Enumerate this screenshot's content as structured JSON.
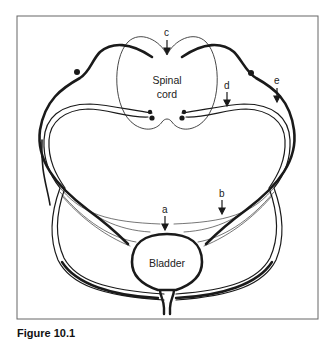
{
  "figure": {
    "caption": "Figure 10.1",
    "colors": {
      "stroke": "#1a1a1a",
      "frame": "#555555",
      "background": "#ffffff"
    }
  },
  "labels": {
    "spinal_cord_line1": "Spinal",
    "spinal_cord_line2": "cord",
    "bladder": "Bladder",
    "a": "a",
    "b": "b",
    "c": "c",
    "d": "d",
    "e": "e"
  }
}
